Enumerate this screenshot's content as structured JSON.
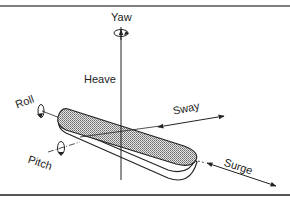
{
  "figure": {
    "labels": {
      "yaw": "Yaw",
      "heave": "Heave",
      "roll": "Roll",
      "pitch": "Pitch",
      "sway": "Sway",
      "surge": "Surge"
    },
    "colors": {
      "line": "#222222",
      "rule": "#555555",
      "hull_fill": "#bdbdbd",
      "background": "#ffffff"
    }
  }
}
